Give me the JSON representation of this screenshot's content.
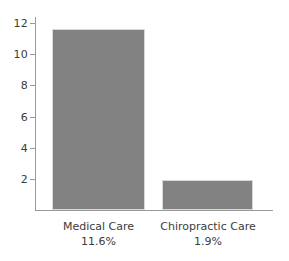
{
  "chart_data": {
    "type": "bar",
    "title": "",
    "subtitle": "",
    "xlabel": "",
    "ylabel": "",
    "categories": [
      "Medical Care",
      "Chiropractic Care"
    ],
    "values": [
      11.6,
      1.9
    ],
    "value_labels": [
      "11.6%",
      "1.9%"
    ],
    "ylim": [
      0,
      12.4
    ],
    "yticks": [
      2,
      4,
      6,
      8,
      10,
      12
    ],
    "ytick_labels": [
      "2",
      "4",
      "6",
      "8",
      "10",
      "12"
    ],
    "grid": false,
    "legend": null,
    "legend_position": "none",
    "bar_color": "#828282",
    "bar_edge_color": "#d8d8d8",
    "axis_color": "#9a9a9a",
    "text_color": "#3c3c3c",
    "background": "#ffffff"
  },
  "axes": {
    "y": {
      "ticks": [
        {
          "label": "12",
          "value": 12
        },
        {
          "label": "10",
          "value": 10
        },
        {
          "label": "8",
          "value": 8
        },
        {
          "label": "6",
          "value": 6
        },
        {
          "label": "4",
          "value": 4
        },
        {
          "label": "2",
          "value": 2
        }
      ]
    }
  },
  "bars": [
    {
      "name": "Medical Care",
      "value_label": "11.6%",
      "value": 11.6
    },
    {
      "name": "Chiropractic Care",
      "value_label": "1.9%",
      "value": 1.9
    }
  ]
}
